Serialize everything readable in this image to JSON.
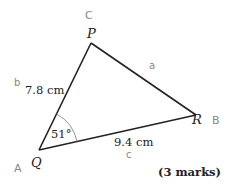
{
  "diagram": {
    "vertices": {
      "P": {
        "label": "P",
        "annotation": "C"
      },
      "Q": {
        "label": "Q",
        "annotation": "A"
      },
      "R": {
        "label": "R",
        "annotation": "B"
      }
    },
    "sides": {
      "PQ": {
        "length": "7.8 cm",
        "annotation": "b"
      },
      "PR": {
        "annotation": "a"
      },
      "QR": {
        "length": "9.4 cm",
        "annotation": "c"
      }
    },
    "angle_Q": "51°",
    "marks": "(3 marks)"
  }
}
